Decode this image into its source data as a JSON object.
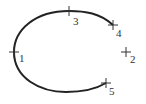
{
  "diagram": {
    "type": "arc-with-labeled-points",
    "arc": {
      "description": "open elliptical arc through points 4, 3, 1, 5",
      "color": "#222222"
    },
    "points": [
      {
        "label": "1",
        "x": 14,
        "y": 52,
        "label_x": 19,
        "label_y": 62,
        "on_arc": true
      },
      {
        "label": "2",
        "x": 126,
        "y": 52,
        "label_x": 130,
        "label_y": 63,
        "on_arc": false
      },
      {
        "label": "3",
        "x": 69,
        "y": 11,
        "label_x": 73,
        "label_y": 25,
        "on_arc": true
      },
      {
        "label": "4",
        "x": 113,
        "y": 25,
        "label_x": 116,
        "label_y": 37,
        "on_arc": true
      },
      {
        "label": "5",
        "x": 106,
        "y": 83,
        "label_x": 109,
        "label_y": 95,
        "on_arc": true
      }
    ]
  }
}
